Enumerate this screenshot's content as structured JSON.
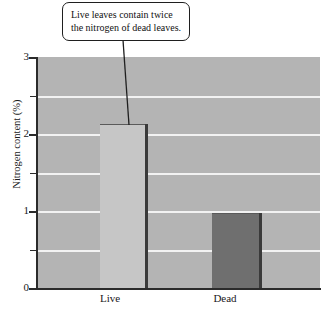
{
  "chart_data": {
    "type": "bar",
    "title": "",
    "subtitle": "",
    "xlabel": "",
    "ylabel": "Nitrogen content (%)",
    "categories": [
      "Live",
      "Dead"
    ],
    "values": [
      2.13,
      0.97
    ],
    "series": [
      {
        "name": "Nitrogen content",
        "values": [
          2.13,
          0.97
        ],
        "colors": [
          "#c6c6c6",
          "#6f6f6f"
        ]
      }
    ],
    "ylim": [
      0,
      3
    ],
    "yticks": [
      0,
      1,
      2,
      3
    ],
    "ytick_labels": [
      "0",
      "1",
      "2",
      "3"
    ],
    "yticks_minor": [
      0.5,
      1.5,
      2.5
    ],
    "grid": true,
    "gridlines_at": [
      0.5,
      1.0,
      1.5,
      2.0,
      2.5
    ],
    "gridline_color": "#f2f2f2",
    "plot_background": "#b4b4b4",
    "legend": "none",
    "annotations": [
      {
        "text": "Live leaves contain twice the nitrogen of dead leaves.",
        "points_to": "Live",
        "style": "rounded-callout-box-with-leader-line"
      }
    ]
  },
  "callout": {
    "line1": "Live leaves contain twice",
    "line2": "the nitrogen of dead leaves."
  },
  "axis": {
    "y_title": "Nitrogen content (%)",
    "y_labels": [
      "3",
      "2",
      "1",
      "0"
    ],
    "x_labels": [
      "Live",
      "Dead"
    ]
  },
  "colors": {
    "plot_bg": "#b4b4b4",
    "gridline": "#f2f2f2",
    "bar_live": "#c6c6c6",
    "bar_dead": "#6f6f6f",
    "bar_edge": "#3a3a3a",
    "axis": "#2b2b2b",
    "text": "#1a1a1a",
    "callout_border": "#1f1f1f",
    "callout_bg": "#ffffff"
  }
}
